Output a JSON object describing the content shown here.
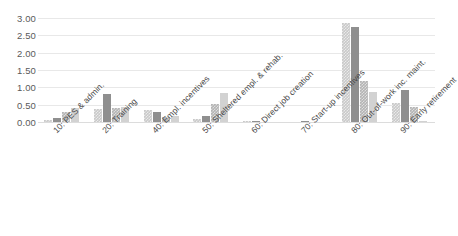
{
  "chart_data": {
    "type": "bar",
    "title": "",
    "subtitle": "",
    "xlabel": "",
    "ylabel": "",
    "ylim": [
      0,
      3.0
    ],
    "ytick_step": 0.5,
    "ytick_labels": [
      "0.00",
      "0.50",
      "1.00",
      "1.50",
      "2.00",
      "2.50",
      "3.00"
    ],
    "ytick_values": [
      0,
      0.5,
      1.0,
      1.5,
      2.0,
      2.5,
      3.0
    ],
    "grid": "horizontal",
    "legend": "none",
    "categories": [
      "10: PES & admin.",
      "20: Training",
      "40: Empl. incentives",
      "50: Sheltered empl. & rehab.",
      "60: Direct job creation",
      "70: Start-up incentives",
      "80: Out-of-work inc. maint.",
      "90: Early retirement"
    ],
    "series": [
      {
        "name": "Series 1",
        "color": "#c9c9c9",
        "fill": "checkered-light",
        "values": [
          0.06,
          0.37,
          0.35,
          0.08,
          0.03,
          0.0,
          2.85,
          0.56
        ]
      },
      {
        "name": "Series 2",
        "color": "#8f8f8f",
        "fill": "solid-dark",
        "values": [
          0.13,
          0.82,
          0.3,
          0.17,
          0.02,
          0.02,
          2.75,
          0.91
        ]
      },
      {
        "name": "Series 3",
        "color": "#b4b4b4",
        "fill": "checkered-medium",
        "values": [
          0.28,
          0.41,
          0.15,
          0.51,
          0.0,
          0.0,
          1.18,
          0.44
        ]
      },
      {
        "name": "Series 4",
        "color": "#d2d2d2",
        "fill": "solid-light",
        "values": [
          0.4,
          0.43,
          0.16,
          0.85,
          0.0,
          0.0,
          0.87,
          0.04
        ]
      }
    ]
  }
}
